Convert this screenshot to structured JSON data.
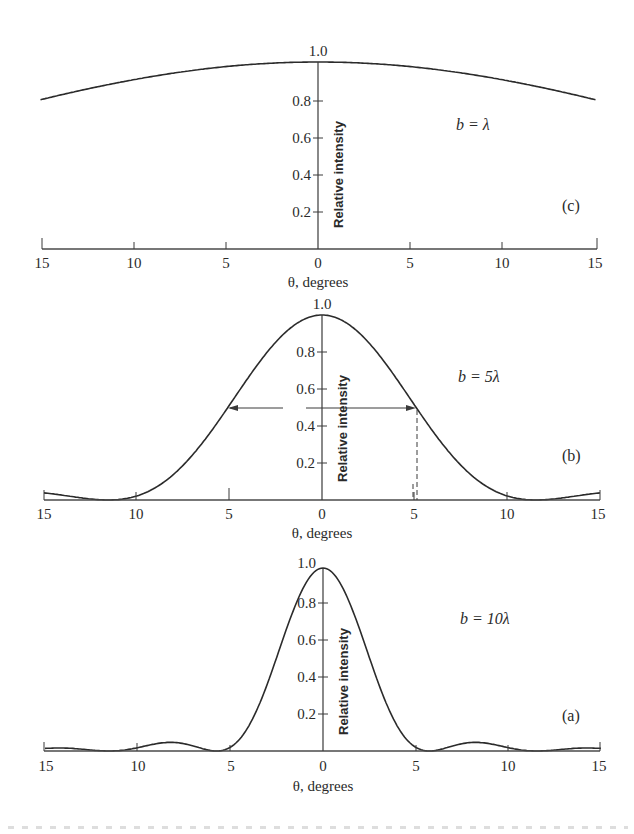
{
  "chart_data": [
    {
      "type": "line",
      "panel": "(c)",
      "annotation": "b = λ",
      "slit_width_over_lambda": 1,
      "title": "",
      "xlabel": "θ, degrees",
      "ylabel": "Relative intensity",
      "x_ticks": [
        15,
        10,
        5,
        0,
        5,
        10,
        15
      ],
      "y_ticks": [
        "0.2",
        "0.4",
        "0.6",
        "0.8",
        "1.0"
      ],
      "xlim": [
        -15,
        15
      ],
      "ylim": [
        0,
        1.0
      ],
      "grid": false,
      "x": [
        -15,
        -12.5,
        -10,
        -7.5,
        -5,
        -2.5,
        0,
        2.5,
        5,
        7.5,
        10,
        12.5,
        15
      ],
      "values": [
        0.8,
        0.86,
        0.91,
        0.95,
        0.98,
        0.99,
        1.0,
        0.99,
        0.98,
        0.95,
        0.91,
        0.86,
        0.8
      ]
    },
    {
      "type": "line",
      "panel": "(b)",
      "annotation": "b = 5λ",
      "slit_width_over_lambda": 5,
      "title": "",
      "xlabel": "θ, degrees",
      "ylabel": "Relative intensity",
      "x_ticks": [
        15,
        10,
        5,
        0,
        5,
        10,
        15
      ],
      "y_ticks": [
        "0.2",
        "0.4",
        "0.6",
        "0.8",
        "1.0"
      ],
      "xlim": [
        -15,
        15
      ],
      "ylim": [
        0,
        1.0
      ],
      "grid": false,
      "half_width_marker": {
        "intensity": 0.5,
        "theta_left": -5.1,
        "theta_right": 5.1
      },
      "x": [
        -15,
        -12.5,
        -11.5,
        -10,
        -7.5,
        -5,
        -2.5,
        0,
        2.5,
        5,
        7.5,
        10,
        11.5,
        12.5,
        15
      ],
      "values": [
        0.04,
        0.005,
        0.0,
        0.02,
        0.24,
        0.5,
        0.84,
        1.0,
        0.84,
        0.5,
        0.24,
        0.02,
        0.0,
        0.005,
        0.04
      ]
    },
    {
      "type": "line",
      "panel": "(a)",
      "annotation": "b = 10λ",
      "slit_width_over_lambda": 10,
      "title": "",
      "xlabel": "θ, degrees",
      "ylabel": "Relative intensity",
      "x_ticks": [
        15,
        10,
        5,
        0,
        5,
        10,
        15
      ],
      "y_ticks": [
        "0.2",
        "0.4",
        "0.6",
        "0.8",
        "1.0"
      ],
      "xlim": [
        -15,
        15
      ],
      "ylim": [
        0,
        1.0
      ],
      "grid": false,
      "x": [
        -15,
        -12.5,
        -10,
        -8.6,
        -5.7,
        -4,
        -2.5,
        -1,
        0,
        1,
        2.5,
        4,
        5.7,
        8.6,
        10,
        12.5,
        15
      ],
      "values": [
        0.01,
        0.005,
        0.03,
        0.047,
        0.0,
        0.11,
        0.52,
        0.9,
        1.0,
        0.9,
        0.52,
        0.11,
        0.0,
        0.047,
        0.03,
        0.005,
        0.01
      ]
    }
  ],
  "labels": {
    "c": {
      "panel": "(c)",
      "annotation": "b = λ",
      "xlabel": "θ, degrees",
      "ylabel": "Relative intensity"
    },
    "b": {
      "panel": "(b)",
      "annotation": "b = 5λ",
      "xlabel": "θ, degrees",
      "ylabel": "Relative intensity"
    },
    "a": {
      "panel": "(a)",
      "annotation": "b = 10λ",
      "xlabel": "θ, degrees",
      "ylabel": "Relative intensity"
    },
    "x_ticks": [
      "15",
      "10",
      "5",
      "0",
      "5",
      "10",
      "15"
    ],
    "y_ticks": [
      "0.2",
      "0.4",
      "0.6",
      "0.8",
      "1.0"
    ]
  }
}
